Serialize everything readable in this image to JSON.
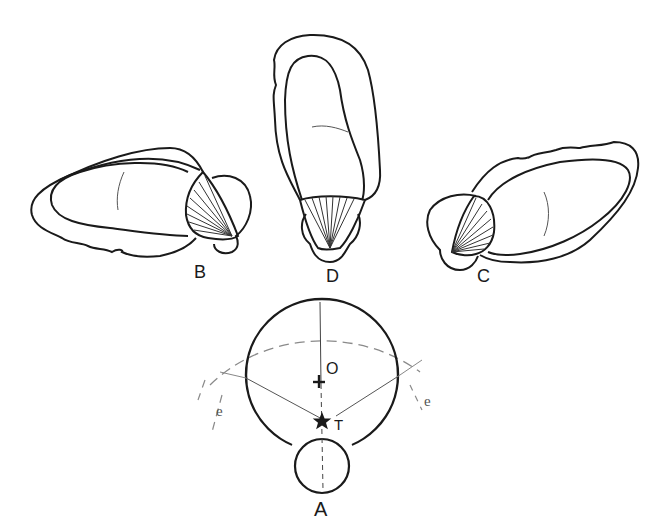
{
  "figure": {
    "panels": [
      {
        "id": "A",
        "label": "A"
      },
      {
        "id": "B",
        "label": "B"
      },
      {
        "id": "C",
        "label": "C"
      },
      {
        "id": "D",
        "label": "D"
      }
    ],
    "annotations": {
      "center": "O",
      "point": "T",
      "edge_left": "e",
      "edge_right": "e"
    },
    "colors": {
      "stroke": "#1a1a1a",
      "thin_stroke": "#333333",
      "dashed": "#8a8a8a",
      "background": "#ffffff"
    }
  }
}
